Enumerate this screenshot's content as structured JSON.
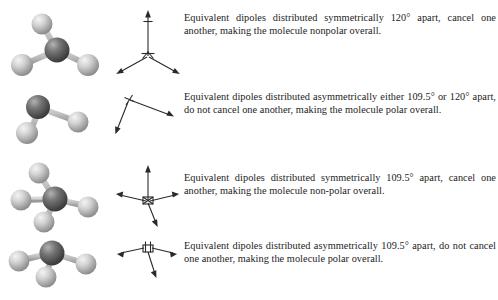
{
  "figure": {
    "background_color": "#ffffff",
    "text_color": "#1c1c1c",
    "atom_colors": {
      "central_atom": "#6e6e6e",
      "central_atom_highlight": "#a8a8a8",
      "central_atom_shadow": "#3c3c3c",
      "terminal_atom": "#c9c9c9",
      "terminal_atom_highlight": "#efefef",
      "terminal_atom_shadow": "#8e8e8e",
      "bond": "#b5b5b5",
      "arrow": "#2a2a2a"
    }
  },
  "rows": [
    {
      "id": "trigonal-planar-nonpolar",
      "molecule_name": "trigonal-planar-molecule",
      "geometry": "trigonal planar",
      "dipole_name": "dipole-vectors-trigonal-symmetric",
      "arrow_count": 3,
      "symmetry": "symmetric",
      "angle_label": "120°",
      "polarity": "nonpolar",
      "text": "Equivalent dipoles distributed symmetrically 120° apart, cancel one another, making the molecule nonpolar overall."
    },
    {
      "id": "bent-polar",
      "molecule_name": "bent-molecule",
      "geometry": "bent",
      "dipole_name": "dipole-vectors-bent-asymmetric",
      "arrow_count": 2,
      "symmetry": "asymmetric",
      "angle_label": "109.5° or 120°",
      "polarity": "polar",
      "text": "Equivalent dipoles distributed asymmetrically either 109.5° or 120° apart, do not cancel one another, making the molecule polar overall."
    },
    {
      "id": "tetrahedral-nonpolar",
      "molecule_name": "tetrahedral-molecule",
      "geometry": "tetrahedral",
      "dipole_name": "dipole-vectors-tetrahedral-symmetric",
      "arrow_count": 4,
      "symmetry": "symmetric",
      "angle_label": "109.5°",
      "polarity": "non-polar",
      "text": "Equivalent dipoles distributed symmetrically 109.5° apart, cancel one another, making the molecule non-polar overall."
    },
    {
      "id": "trigonal-pyramidal-polar",
      "molecule_name": "trigonal-pyramidal-molecule",
      "geometry": "trigonal pyramidal",
      "dipole_name": "dipole-vectors-pyramidal-asymmetric",
      "arrow_count": 3,
      "symmetry": "asymmetric",
      "angle_label": "109.5°",
      "polarity": "polar",
      "text": "Equivalent dipoles distributed asymmetrically 109.5° apart, do not cancel one another, making the molecule polar overall."
    }
  ]
}
